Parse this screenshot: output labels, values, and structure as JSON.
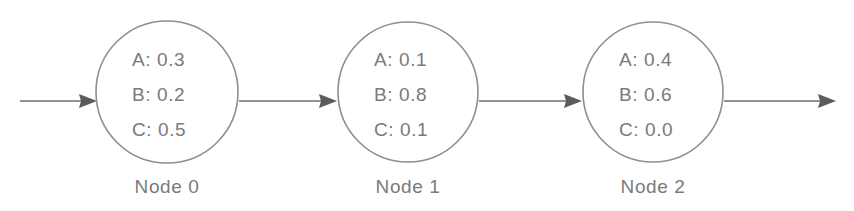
{
  "diagram": {
    "type": "node-chain-flow",
    "background_color": "#ffffff",
    "stroke_color": "#8e8e8e",
    "text_color": "#7a7a7a",
    "arrow_color": "#5c5c5c",
    "keys": [
      "A",
      "B",
      "C"
    ],
    "nodes": [
      {
        "id": "node-0",
        "label": "Node 0",
        "cx": 167,
        "cy": 92,
        "r": 71,
        "lines": [
          "A: 0.3",
          "B: 0.2",
          "C: 0.5"
        ],
        "values": {
          "A": 0.3,
          "B": 0.2,
          "C": 0.5
        }
      },
      {
        "id": "node-1",
        "label": "Node 1",
        "cx": 408,
        "cy": 92,
        "r": 70,
        "lines": [
          "A: 0.1",
          "B: 0.8",
          "C: 0.1"
        ],
        "values": {
          "A": 0.1,
          "B": 0.8,
          "C": 0.1
        }
      },
      {
        "id": "node-2",
        "label": "Node 2",
        "cx": 653,
        "cy": 92,
        "r": 70,
        "lines": [
          "A: 0.4",
          "B: 0.6",
          "C: 0.0"
        ],
        "values": {
          "A": 0.4,
          "B": 0.6,
          "C": 0.0
        }
      }
    ],
    "edges": [
      {
        "id": "edge-in",
        "from": "input",
        "to": "node-0",
        "x1": 20,
        "x2": 97,
        "y": 101
      },
      {
        "id": "edge-0-1",
        "from": "node-0",
        "to": "node-1",
        "x1": 239,
        "x2": 337,
        "y": 101
      },
      {
        "id": "edge-1-2",
        "from": "node-1",
        "to": "node-2",
        "x1": 479,
        "x2": 582,
        "y": 101
      },
      {
        "id": "edge-out",
        "from": "node-2",
        "to": "output",
        "x1": 724,
        "x2": 836,
        "y": 101
      }
    ]
  }
}
